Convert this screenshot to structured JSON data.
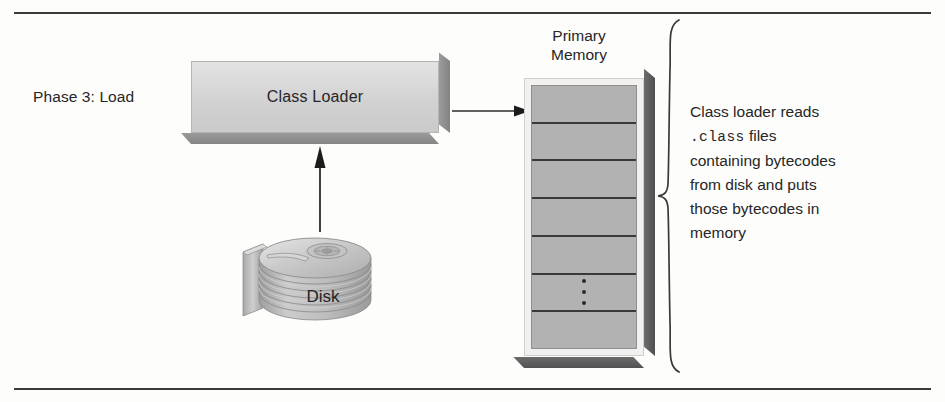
{
  "figure": {
    "phase_label": "Phase 3: Load",
    "class_loader_label": "Class Loader",
    "disk_label": "Disk",
    "primary_memory_line1": "Primary",
    "primary_memory_line2": "Memory",
    "annotation": {
      "line1": "Class loader reads",
      "mono_token": ".class",
      "line2_rest": " files",
      "line3": "containing bytecodes",
      "line4": "from disk and puts",
      "line5": "those bytecodes in",
      "line6": "memory"
    },
    "memory_cells": [
      "",
      "",
      "",
      "",
      "",
      "ellipsis",
      ""
    ],
    "colors": {
      "box_face": "#d2d2d2",
      "box_shadow": "#8c8c8c",
      "memory_face": "#b2b2b2",
      "memory_shadow": "#5a5a5a",
      "ink": "#262626",
      "rule": "#3b3b3b"
    }
  }
}
